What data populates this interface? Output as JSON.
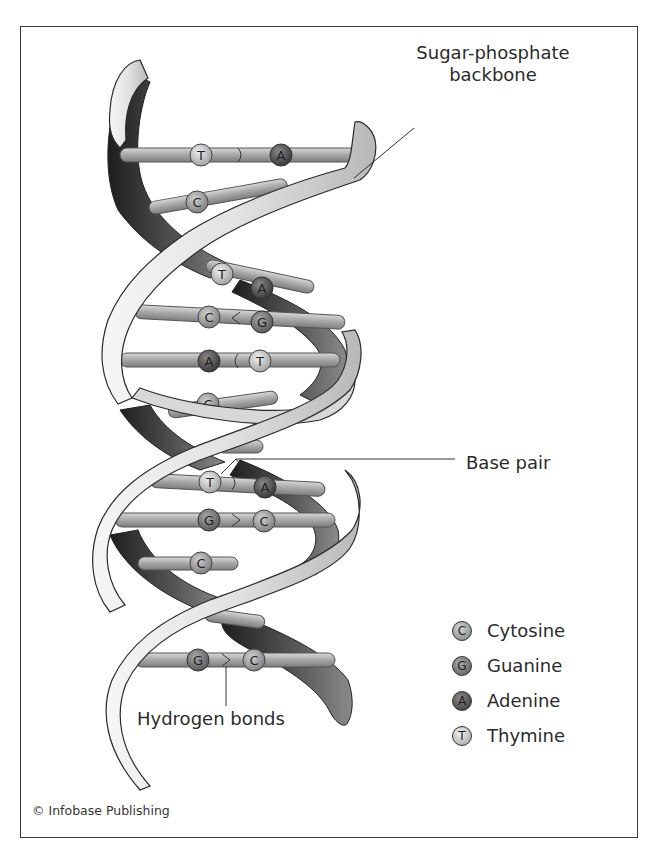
{
  "figure": {
    "credit": "© Infobase Publishing"
  },
  "labels": {
    "backbone_line1": "Sugar-phosphate",
    "backbone_line2": "backbone",
    "base_pair": "Base pair",
    "hydrogen_bonds": "Hydrogen bonds"
  },
  "legend": {
    "items": [
      {
        "letter": "C",
        "label": "Cytosine",
        "color": "#9a9a9a"
      },
      {
        "letter": "G",
        "label": "Guanine",
        "color": "#6f6f6f"
      },
      {
        "letter": "A",
        "label": "Adenine",
        "color": "#4e4e4e"
      },
      {
        "letter": "T",
        "label": "Thymine",
        "color": "#c9c9c9"
      }
    ]
  },
  "base_pairs": [
    {
      "left": "T",
      "right": "A"
    },
    {
      "left": "C",
      "right": "G"
    },
    {
      "left": "T",
      "right": "A"
    },
    {
      "left": "C",
      "right": "G"
    },
    {
      "left": "A",
      "right": "T"
    },
    {
      "left": "C",
      "right": "G"
    },
    {
      "left": "T",
      "right": "A"
    },
    {
      "left": "G",
      "right": "C"
    },
    {
      "left": "C",
      "right": "G"
    },
    {
      "left": "G",
      "right": "C"
    }
  ],
  "colors": {
    "front_strand": "#e6e6e6",
    "back_strand": "#3a3a3a",
    "rod": "#a8a8a8",
    "frame_border": "#3a3a3a"
  }
}
